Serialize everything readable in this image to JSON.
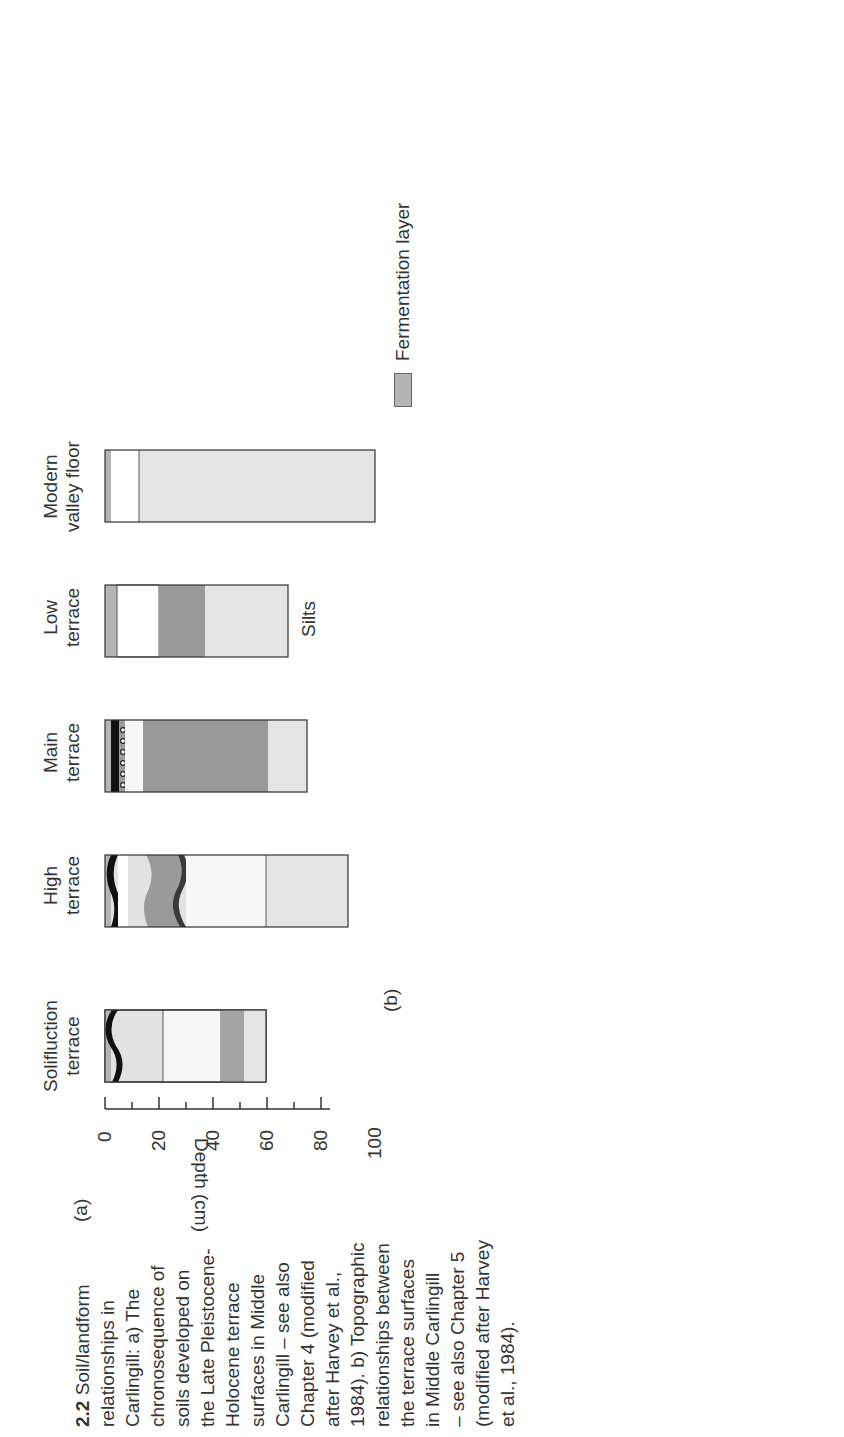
{
  "caption": {
    "number": "2.2",
    "text": "Soil/landform relationships in Carlingill: a) The chronosequence of soils developed on the Late Pleistocene-Holocene terrace surfaces in Middle Carlingill – see also Chapter 4 (modified after Harvey et al., 1984). b) Topographic relationships between the terrace surfaces in Middle Carlingill – see also Chapter 5 (modified after Harvey et al., 1984).",
    "lines": [
      "Soil/landform",
      "relationships in",
      "Carlingill: a) The",
      "chronosequence of",
      "soils developed on",
      "the Late Pleistocene-",
      "Holocene terrace",
      "surfaces in Middle",
      "Carlingill – see also",
      "Chapter 4 (modified",
      "after Harvey et al.,",
      "1984). b) Topographic",
      "relationships between",
      "the terrace surfaces",
      "in Middle Carlingill",
      "– see also Chapter 5",
      "(modified after Harvey",
      "et al., 1984)."
    ]
  },
  "panel_a": {
    "label": "(a)",
    "axis": {
      "label": "Depth (cm)",
      "ticks": [
        "0",
        "20",
        "40",
        "60",
        "80",
        "100"
      ]
    },
    "profiles": [
      {
        "name": "Solifluction terrace",
        "line1": "Solifluction",
        "line2": "terrace",
        "depth_cm": 60
      },
      {
        "name": "High terrace",
        "line1": "High",
        "line2": "terrace",
        "depth_cm": 90
      },
      {
        "name": "Main terrace",
        "line1": "Main",
        "line2": "terrace",
        "depth_cm": 75
      },
      {
        "name": "Low terrace",
        "line1": "Low",
        "line2": "terrace",
        "depth_cm": 68,
        "note": "Silts"
      },
      {
        "name": "Modern valley floor",
        "line1": "Modern",
        "line2": "valley floor",
        "depth_cm": 100
      }
    ],
    "legend": [
      {
        "label": "Fermentation layer",
        "color": "#b4b4b4"
      },
      {
        "label": "Humus",
        "color": "#111111"
      },
      {
        "label": "Humus, gravel and coarse sand",
        "color": "#9a9a9a"
      },
      {
        "label": "A Horizon or incipient A Horizon",
        "color": "#ffffff"
      },
      {
        "label": "Ae Horizon",
        "color": "#e2e2e2"
      },
      {
        "label": "Iron oxide mottles",
        "color": "#9c9c9c"
      },
      {
        "label": "Bh Horizon",
        "color": "#9a9a9a"
      },
      {
        "label": "Bfe Horizon",
        "color": "#3a3a3a"
      },
      {
        "label": "Bs Horizon",
        "color": "#f6f6f6"
      },
      {
        "label": "B/C Horizon",
        "color": "#a4a4a4"
      },
      {
        "label": "C Horizon",
        "color": "#e4e4e4"
      }
    ]
  },
  "panel_b": {
    "label": "(b)",
    "legend": [
      {
        "label": "Stream and fan gravels",
        "icon": "gravel-icon"
      },
      {
        "label": "Solifluncted till",
        "icon": "wedge-icon"
      },
      {
        "label": "Laminated clays",
        "icon": "lamination-icon"
      },
      {
        "label": "Till",
        "icon": "triangle-icon"
      },
      {
        "label": "Bedrock (Silurian rocks)",
        "icon": "bedrock-icon"
      }
    ],
    "labels": {
      "solifluction_terrace": [
        "Solifluction",
        "terrace"
      ],
      "height_15_20": "15 - 20m",
      "tributary_channel_left": [
        "Tributary",
        "channel"
      ],
      "tributary_fan": [
        "Tributary",
        "fan"
      ],
      "low_terrace": [
        "Low",
        "terrace",
        "c.2m"
      ],
      "c1m": "c.1m",
      "modern_floodplain": [
        "Modern",
        "floodplain",
        "and channel",
        "(post 1948)"
      ],
      "main_terrace": [
        "Main",
        "terrace",
        "4m"
      ],
      "high_terrace": [
        "High",
        "terrace",
        "8m"
      ],
      "tributary_fan_segments": [
        "Tributary",
        "fan",
        "segments"
      ],
      "tributary_channel_right": [
        "Tributary",
        "channel"
      ]
    }
  }
}
